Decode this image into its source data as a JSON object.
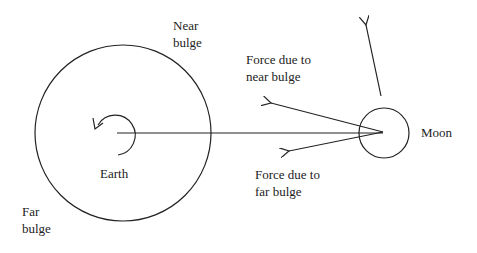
{
  "diagram": {
    "labels": {
      "near_bulge": "Near\nbulge",
      "far_bulge": "Far\nbulge",
      "earth": "Earth",
      "moon": "Moon",
      "force_near": "Force due to\nnear bulge",
      "force_far": "Force due to\nfar bulge"
    },
    "nodes": [
      {
        "id": "earth",
        "shape": "circle",
        "label": "Earth"
      },
      {
        "id": "moon",
        "shape": "circle",
        "label": "Moon"
      }
    ],
    "edges": [
      {
        "from": "earth",
        "to": "moon",
        "type": "line"
      },
      {
        "from": "moon",
        "to": "near-bulge-direction",
        "type": "arrow",
        "label": "Force due to near bulge"
      },
      {
        "from": "moon",
        "to": "far-bulge-direction",
        "type": "arrow",
        "label": "Force due to far bulge"
      },
      {
        "from": "moon",
        "to": "orbital-direction",
        "type": "arrow"
      }
    ],
    "colors": {
      "stroke": "#222222",
      "background": "#ffffff"
    }
  }
}
